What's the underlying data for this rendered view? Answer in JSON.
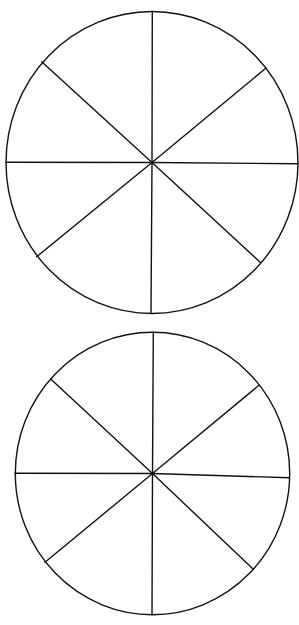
{
  "diagram": {
    "type": "blank-segmented-circles",
    "background": "#ffffff",
    "stroke_color": "#111111",
    "stroke_width": 1.4,
    "circles": [
      {
        "name": "top-circle",
        "segments": 8,
        "center": [
          152,
          162.5
        ],
        "rx": 146,
        "ry": 151,
        "spoke_endpoints": [
          [
            152.3,
            11.5
          ],
          [
            265.7,
            68.3
          ],
          [
            297.7,
            163.7
          ],
          [
            260.7,
            262.7
          ],
          [
            151.0,
            312.7
          ],
          [
            36.7,
            256.7
          ],
          [
            6.0,
            162.3
          ],
          [
            41.7,
            61.7
          ]
        ]
      },
      {
        "name": "bottom-circle",
        "segments": 8,
        "center": [
          152.5,
          473.5
        ],
        "rx": 137.2,
        "ry": 141.2,
        "spoke_endpoints": [
          [
            153.3,
            332.3
          ],
          [
            259.3,
            385.0
          ],
          [
            289.3,
            477.7
          ],
          [
            253.3,
            569.3
          ],
          [
            152.0,
            614.7
          ],
          [
            45.0,
            562.3
          ],
          [
            15.0,
            473.3
          ],
          [
            50.7,
            379.0
          ]
        ]
      }
    ]
  }
}
